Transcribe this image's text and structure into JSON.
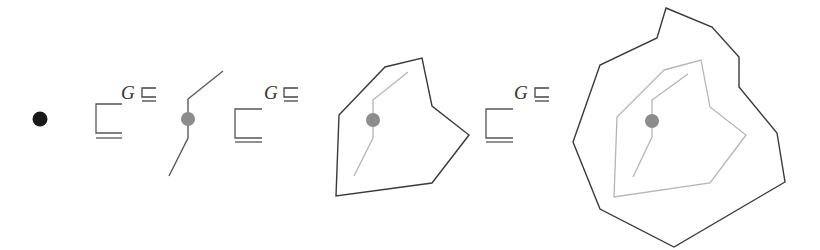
{
  "diagram": {
    "colors": {
      "point": "#1a1a1a",
      "center_dot": "#8c8c8c",
      "outer_line": "#3a3a3a",
      "inner_line": "#b5b5b5",
      "symbol": "#444444"
    },
    "symbols": [
      {
        "label": "G",
        "relation": "⊑"
      },
      {
        "label": "G",
        "relation": "⊑"
      },
      {
        "label": "G",
        "relation": "⊑"
      }
    ],
    "stages": [
      {
        "name": "point"
      },
      {
        "name": "path"
      },
      {
        "name": "polygon"
      },
      {
        "name": "nested-polygon"
      }
    ]
  }
}
